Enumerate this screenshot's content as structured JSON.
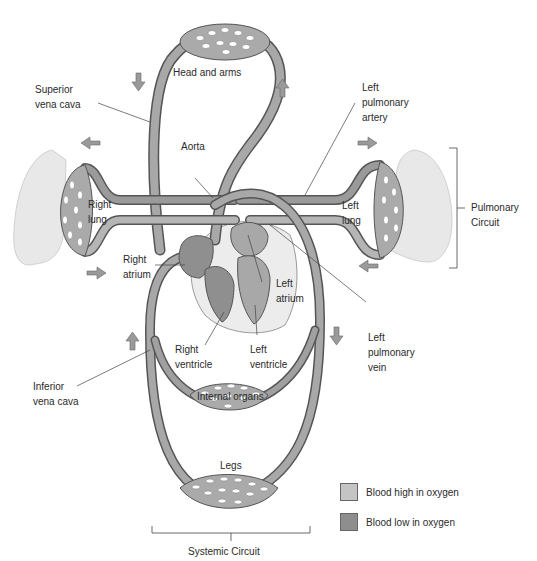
{
  "labels": {
    "head_and_arms": "Head and arms",
    "superior_vena_cava": "Superior\nvena cava",
    "left_pulmonary_artery": "Left\npulmonary\nartery",
    "aorta": "Aorta",
    "right_lung": "Right\nlung",
    "left_lung": "Left\nlung",
    "pulmonary_circuit": "Pulmonary\nCircuit",
    "right_atrium": "Right\natrium",
    "left_atrium": "Left\natrium",
    "left_pulmonary_vein": "Left\npulmonary\nvein",
    "right_ventricle": "Right\nventricle",
    "left_ventricle": "Left\nventricle",
    "inferior_vena_cava": "Inferior\nvena cava",
    "internal_organs": "Internal organs",
    "legs": "Legs",
    "systemic_circuit": "Systemic Circuit"
  },
  "legend": {
    "items": [
      {
        "label": "Blood high in oxygen",
        "color": "#c4c4c4"
      },
      {
        "label": "Blood low in oxygen",
        "color": "#8e8e8e"
      }
    ]
  },
  "colors": {
    "vessel_high": "#b5b5b5",
    "vessel_low": "#8f8f8f",
    "vessel_outline": "#555555",
    "lung_tissue": "#e6e6e6",
    "pericardium": "#ececec",
    "arrow_fill": "#9a9a9a"
  }
}
